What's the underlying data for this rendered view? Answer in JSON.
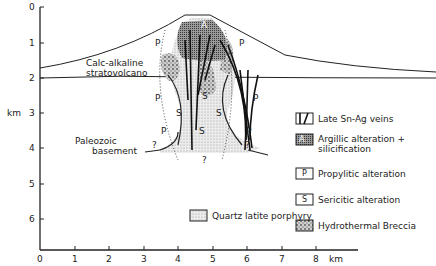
{
  "figure": {
    "type": "geological cross-section",
    "y_axis": {
      "label": "km",
      "ticks": [
        "0",
        "1",
        "2",
        "3",
        "4",
        "5",
        "6"
      ]
    },
    "x_axis": {
      "unit_label": "km",
      "ticks": [
        "0",
        "1",
        "2",
        "3",
        "4",
        "5",
        "6",
        "7",
        "8"
      ]
    },
    "units": {
      "stratovolcano": "Calc-alkaline\nstratovolcano",
      "stratovolcano_line1": "Calc-alkaline",
      "stratovolcano_line2": "stratovolcano",
      "basement_line1": "Paleozoic",
      "basement_line2": "basement"
    },
    "map_symbols": {
      "propylitic": "P",
      "sericitic": "S",
      "argillic": "A",
      "uncertain": "?"
    },
    "legend": {
      "items": [
        {
          "symbol": "vein-symbol",
          "label": "Late Sn-Ag veins"
        },
        {
          "symbol": "A",
          "label_line1": "Argillic  alteration +",
          "label_line2": "silicification"
        },
        {
          "symbol": "P",
          "label": "Propylitic alteration"
        },
        {
          "symbol": "S",
          "label": "Sericitic  alteration"
        },
        {
          "symbol": "breccia-pattern",
          "label": "Hydrothermal  Breccia"
        },
        {
          "symbol": "stipple-pattern",
          "label": "Quartz latite porphyry"
        }
      ]
    },
    "colors": {
      "ink": "#222222",
      "background": "#ffffff",
      "stipple": "#c8c8c8",
      "breccia": "#8a8a8a",
      "argillic": "#555555"
    }
  }
}
